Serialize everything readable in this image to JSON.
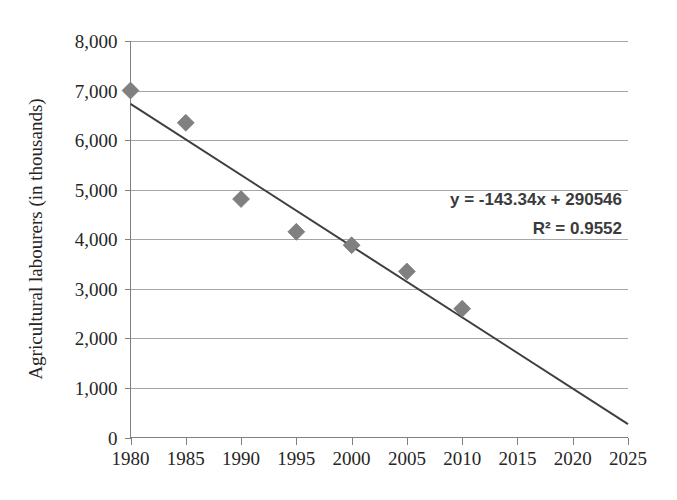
{
  "chart_data": {
    "type": "scatter",
    "title": "",
    "xlabel": "",
    "ylabel": "Agricultural labourers (in thousands)",
    "x": [
      1980,
      1985,
      1990,
      1995,
      2000,
      2005,
      2010
    ],
    "values": [
      7000,
      6350,
      4810,
      4150,
      3880,
      3350,
      2600
    ],
    "series": [
      {
        "name": "Agricultural labourers",
        "marker": "diamond",
        "color": "#808080",
        "values": [
          7000,
          6350,
          4810,
          4150,
          3880,
          3350,
          2600
        ]
      }
    ],
    "xlim": [
      1980,
      2025
    ],
    "ylim": [
      0,
      8000
    ],
    "x_ticks": [
      1980,
      1985,
      1990,
      1995,
      2000,
      2005,
      2010,
      2015,
      2020,
      2025
    ],
    "x_tick_labels": [
      "1980",
      "1985",
      "1990",
      "1995",
      "2000",
      "2005",
      "2010",
      "2015",
      "2020",
      "2025"
    ],
    "y_ticks": [
      0,
      1000,
      2000,
      3000,
      4000,
      5000,
      6000,
      7000,
      8000
    ],
    "y_tick_labels": [
      "0",
      "1,000",
      "2,000",
      "3,000",
      "4,000",
      "5,000",
      "6,000",
      "7,000",
      "8,000"
    ],
    "grid": "horizontal",
    "legend": "none",
    "trendline": {
      "type": "linear",
      "slope": -143.34,
      "intercept": 290546,
      "x_start": 1980,
      "x_end": 2025,
      "y_start": 6731,
      "y_end": 270,
      "color": "#3f3f3f"
    },
    "annotations": {
      "equation": "y = -143.34x + 290546",
      "r_squared": "R² = 0.9552"
    }
  },
  "colors": {
    "marker": "#808080",
    "trendline": "#3f3f3f",
    "gridline": "#a6a6a6",
    "axis": "#808080",
    "text": "#262626",
    "annotation_text": "#3b3b3b",
    "background": "#ffffff"
  }
}
